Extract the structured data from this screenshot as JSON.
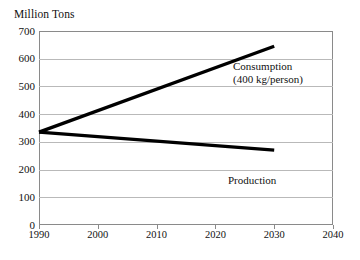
{
  "chart_data": {
    "type": "line",
    "title": "Million Tons",
    "xlabel": "",
    "ylabel": "Million Tons",
    "xlim": [
      1990,
      2040
    ],
    "ylim": [
      0,
      700
    ],
    "grid": true,
    "legend_position": "inline-annotations",
    "x_ticks": [
      "1990",
      "2000",
      "2010",
      "2020",
      "2030",
      "2040"
    ],
    "x_tick_values": [
      1990,
      2000,
      2010,
      2020,
      2030,
      2040
    ],
    "y_ticks": [
      "0",
      "100",
      "200",
      "300",
      "400",
      "500",
      "600",
      "700"
    ],
    "y_tick_values": [
      0,
      100,
      200,
      300,
      400,
      500,
      600,
      700
    ],
    "x": [
      1990,
      2030
    ],
    "series": [
      {
        "name": "Consumption",
        "annotation": "Consumption",
        "annotation_sub": "(400 kg/person)",
        "x": [
          1990,
          2030
        ],
        "values": [
          335,
          645
        ],
        "color": "#000000"
      },
      {
        "name": "Production",
        "annotation": "Production",
        "annotation_sub": "",
        "x": [
          1990,
          2030
        ],
        "values": [
          335,
          270
        ],
        "color": "#000000"
      }
    ]
  },
  "colors": {
    "background": "#ffffff",
    "gridline": "#b9b9b9",
    "frame": "#8a8a8a",
    "line": "#000000",
    "text": "#111111"
  }
}
